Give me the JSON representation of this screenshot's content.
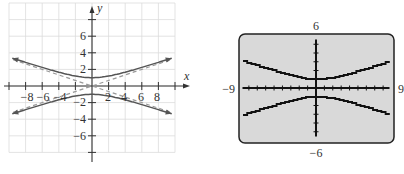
{
  "chart_data": [
    {
      "type": "line",
      "title": "",
      "xlabel": "x",
      "ylabel": "y",
      "xlim": [
        -10,
        10
      ],
      "ylim": [
        -10,
        10
      ],
      "grid": true,
      "x_ticks": [
        -8,
        -6,
        -4,
        -2,
        2,
        4,
        6,
        8
      ],
      "x_tick_labels": [
        "−8",
        "−6",
        "−4",
        "2",
        "4",
        "6",
        "8"
      ],
      "y_ticks": [
        -6,
        -4,
        -2,
        2,
        4,
        6
      ],
      "y_tick_labels": [
        "6",
        "4",
        "2",
        "−2",
        "−4",
        "−6"
      ],
      "series": [
        {
          "name": "hyperbola upper branch",
          "style": "solid",
          "equation": "y = sqrt(1 + x^2/9)",
          "x": [
            -9.5,
            -8,
            -6,
            -4,
            -2,
            0,
            2,
            4,
            6,
            8,
            9.5
          ],
          "y": [
            3.32,
            2.85,
            2.24,
            1.67,
            1.2,
            1.0,
            1.2,
            1.67,
            2.24,
            2.85,
            3.32
          ]
        },
        {
          "name": "hyperbola lower branch",
          "style": "solid",
          "equation": "y = -sqrt(1 + x^2/9)",
          "x": [
            -9.5,
            -8,
            -6,
            -4,
            -2,
            0,
            2,
            4,
            6,
            8,
            9.5
          ],
          "y": [
            -3.32,
            -2.85,
            -2.24,
            -1.67,
            -1.2,
            -1.0,
            -1.2,
            -1.67,
            -2.24,
            -2.85,
            -3.32
          ]
        },
        {
          "name": "asymptote 1",
          "style": "dashed",
          "equation": "y = x/3",
          "x": [
            -9.5,
            9.5
          ],
          "y": [
            -3.17,
            3.17
          ]
        },
        {
          "name": "asymptote 2",
          "style": "dashed",
          "equation": "y = -x/3",
          "x": [
            -9.5,
            9.5
          ],
          "y": [
            3.17,
            -3.17
          ]
        }
      ]
    },
    {
      "type": "line",
      "title": "Graphing calculator display",
      "xlim": [
        -9,
        9
      ],
      "ylim": [
        -6,
        6
      ],
      "window_labels": {
        "ymax": "6",
        "ymin": "−6",
        "xmin": "−9",
        "xmax": "9"
      },
      "series": [
        {
          "name": "upper branch",
          "equation": "y = sqrt(1 + x^2/9)",
          "x": [
            -9,
            -6,
            -3,
            0,
            3,
            6,
            9
          ],
          "y": [
            3.16,
            2.24,
            1.41,
            1.0,
            1.41,
            2.24,
            3.16
          ]
        },
        {
          "name": "lower branch",
          "equation": "y = -sqrt(1 + x^2/9)",
          "x": [
            -9,
            -6,
            -3,
            0,
            3,
            6,
            9
          ],
          "y": [
            -3.16,
            -2.24,
            -1.41,
            -1.0,
            -1.41,
            -2.24,
            -3.16
          ]
        }
      ]
    }
  ],
  "left_graph": {
    "x_axis_label": "x",
    "y_axis_label": "y",
    "x_labels": [
      {
        "text": "−8",
        "x": 27
      },
      {
        "text": "−6",
        "x": 43
      },
      {
        "text": "−4",
        "x": 60
      },
      {
        "text": "2",
        "x": 108
      },
      {
        "text": "4",
        "x": 124
      },
      {
        "text": "6",
        "x": 141
      },
      {
        "text": "8",
        "x": 157
      }
    ],
    "y_labels": [
      {
        "text": "6",
        "y": 40
      },
      {
        "text": "4",
        "y": 57
      },
      {
        "text": "2",
        "y": 73
      },
      {
        "text": "−2",
        "y": 106
      },
      {
        "text": "−4",
        "y": 123
      },
      {
        "text": "−6",
        "y": 140
      }
    ]
  },
  "right_graph": {
    "top_label": "6",
    "bottom_label": "−6",
    "left_label": "−9",
    "right_label": "9",
    "screen_color": "#d9d9d9"
  }
}
